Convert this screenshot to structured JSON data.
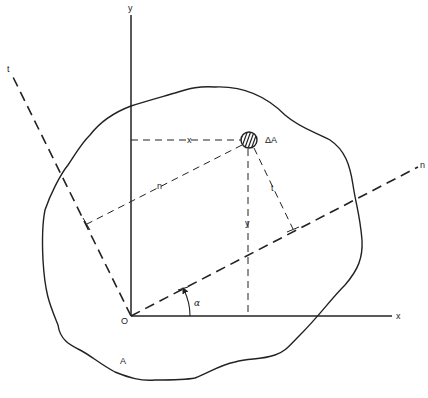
{
  "figure": {
    "colors": {
      "stroke": "#222222",
      "background": "#ffffff"
    },
    "labels": {
      "y_axis": "y",
      "x_axis": "x",
      "n_axis": "n",
      "t_axis": "t",
      "origin": "O",
      "area": "A",
      "element": "ΔA",
      "angle": "α",
      "dist_x": "x",
      "dist_y": "y",
      "dist_n": "n",
      "dist_t": "t"
    }
  }
}
